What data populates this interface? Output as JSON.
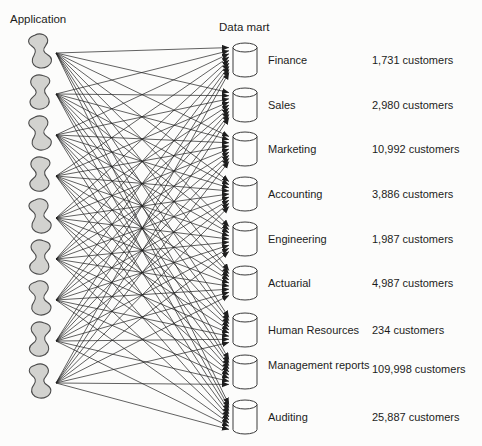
{
  "diagram": {
    "application_column": {
      "title": "Application",
      "count": 9
    },
    "data_mart_column": {
      "title": "Data mart"
    },
    "data_marts": [
      {
        "label": "Finance",
        "customers": "1,731 customers"
      },
      {
        "label": "Sales",
        "customers": "2,980 customers"
      },
      {
        "label": "Marketing",
        "customers": "10,992 customers"
      },
      {
        "label": "Accounting",
        "customers": "3,886 customers"
      },
      {
        "label": "Engineering",
        "customers": "1,987 customers"
      },
      {
        "label": "Actuarial",
        "customers": "4,987 customers"
      },
      {
        "label": "Human Resources",
        "customers": "234 customers"
      },
      {
        "label": "Management reports",
        "customers": "109,998 customers"
      },
      {
        "label": "Auditing",
        "customers": "25,887 customers"
      }
    ],
    "fully_connected": true,
    "icons": {
      "application": "application-blob-icon",
      "data_mart": "data-mart-cylinder-icon",
      "connector": "arrow-connector"
    },
    "colors": {
      "blob_fill": "#d2d2cf",
      "blob_stroke": "#4c4c4c",
      "cylinder_fill": "#fdfdfc",
      "cylinder_stroke": "#3a3a3a",
      "connector": "#1e1e1e",
      "text": "#1c1c1c",
      "background": "#fcfcfb"
    }
  }
}
